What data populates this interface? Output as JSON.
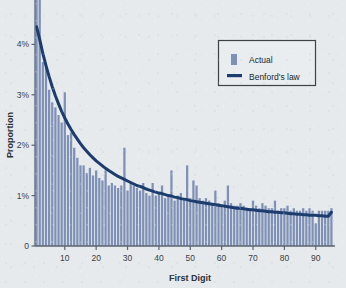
{
  "chart_data": {
    "type": "bar",
    "title": "",
    "subtitle": "",
    "xlabel": "First Digit",
    "ylabel": "Proportion",
    "ylim": [
      0,
      5
    ],
    "xlim": [
      1,
      96
    ],
    "grid": false,
    "y_unit": "%",
    "y_ticks": [
      0,
      1,
      2,
      3,
      4,
      5
    ],
    "y_tick_labels": [
      "0",
      "1%",
      "2%",
      "3%",
      "4%",
      "5%"
    ],
    "x_ticks": [
      10,
      20,
      30,
      40,
      50,
      60,
      70,
      80,
      90
    ],
    "x_tick_labels": [
      "10",
      "20",
      "30",
      "40",
      "50",
      "60",
      "70",
      "80",
      "90"
    ],
    "legend_position": "top-right",
    "legend": [
      {
        "label": "Actual",
        "marker": "bar",
        "color": "#7f90b6"
      },
      {
        "label": "Benford's law",
        "marker": "line",
        "color": "#1d3c6e"
      }
    ],
    "categories": [
      1,
      2,
      3,
      4,
      5,
      6,
      7,
      8,
      9,
      10,
      11,
      12,
      13,
      14,
      15,
      16,
      17,
      18,
      19,
      20,
      21,
      22,
      23,
      24,
      25,
      26,
      27,
      28,
      29,
      30,
      31,
      32,
      33,
      34,
      35,
      36,
      37,
      38,
      39,
      40,
      41,
      42,
      43,
      44,
      45,
      46,
      47,
      48,
      49,
      50,
      51,
      52,
      53,
      54,
      55,
      56,
      57,
      58,
      59,
      60,
      61,
      62,
      63,
      64,
      65,
      66,
      67,
      68,
      69,
      70,
      71,
      72,
      73,
      74,
      75,
      76,
      77,
      78,
      79,
      80,
      81,
      82,
      83,
      84,
      85,
      86,
      87,
      88,
      89,
      90,
      91,
      92,
      93,
      94,
      95
    ],
    "series": [
      {
        "name": "Actual",
        "type": "bar",
        "color": "#7f90b6",
        "values": [
          5.45,
          5.3,
          3.65,
          3.6,
          3.1,
          2.85,
          2.75,
          2.6,
          2.45,
          3.05,
          2.2,
          2.25,
          1.95,
          1.75,
          1.6,
          1.6,
          1.45,
          1.55,
          1.4,
          1.5,
          1.35,
          1.3,
          1.5,
          1.2,
          1.25,
          1.2,
          1.15,
          1.2,
          1.95,
          1.1,
          1.25,
          1.2,
          1.15,
          1.1,
          1.25,
          1.05,
          1.0,
          1.25,
          1.0,
          1.05,
          1.2,
          0.95,
          1.0,
          1.5,
          0.9,
          1.0,
          1.05,
          0.95,
          1.6,
          0.95,
          1.3,
          1.2,
          0.95,
          0.9,
          0.95,
          0.9,
          0.85,
          1.1,
          0.85,
          0.8,
          0.9,
          1.2,
          0.85,
          0.8,
          0.8,
          0.85,
          0.8,
          0.75,
          0.75,
          0.9,
          0.8,
          0.75,
          0.85,
          0.8,
          0.75,
          0.75,
          0.9,
          0.7,
          0.75,
          0.75,
          0.8,
          0.7,
          0.75,
          0.7,
          0.7,
          0.75,
          0.7,
          0.75,
          0.7,
          0.45,
          0.7,
          0.7,
          0.7,
          0.7,
          0.75
        ]
      },
      {
        "name": "Benford's law",
        "type": "line",
        "color": "#1d3c6e",
        "values": [
          4.35,
          4.1,
          3.82,
          3.58,
          3.36,
          3.16,
          2.98,
          2.82,
          2.67,
          2.54,
          2.42,
          2.31,
          2.21,
          2.12,
          2.03,
          1.95,
          1.88,
          1.81,
          1.75,
          1.69,
          1.64,
          1.59,
          1.54,
          1.5,
          1.46,
          1.42,
          1.38,
          1.35,
          1.32,
          1.29,
          1.26,
          1.23,
          1.2,
          1.18,
          1.16,
          1.13,
          1.11,
          1.09,
          1.07,
          1.05,
          1.04,
          1.02,
          1.0,
          0.99,
          0.97,
          0.96,
          0.94,
          0.93,
          0.92,
          0.9,
          0.89,
          0.88,
          0.87,
          0.86,
          0.85,
          0.84,
          0.83,
          0.82,
          0.81,
          0.8,
          0.79,
          0.78,
          0.77,
          0.76,
          0.75,
          0.75,
          0.74,
          0.73,
          0.72,
          0.72,
          0.71,
          0.7,
          0.7,
          0.69,
          0.68,
          0.68,
          0.67,
          0.67,
          0.66,
          0.66,
          0.65,
          0.64,
          0.64,
          0.63,
          0.63,
          0.62,
          0.62,
          0.61,
          0.61,
          0.61,
          0.6,
          0.6,
          0.59,
          0.59,
          0.67
        ]
      }
    ]
  },
  "style": {
    "background": "#e6eaec",
    "bar_color": "#7f90b6",
    "line_color": "#1d3c6e",
    "axis_color": "#5a6570",
    "text_color": "#2b3136",
    "legend_border": "#3c4248",
    "legend_bg": "#e9edef"
  }
}
